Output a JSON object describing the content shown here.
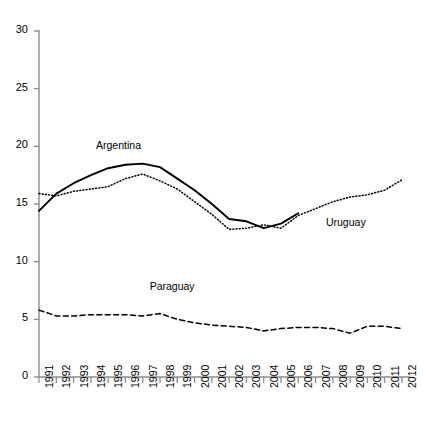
{
  "chart_data": {
    "type": "line",
    "title": "",
    "xlabel": "",
    "ylabel": "",
    "xlim": [
      1991,
      2012
    ],
    "ylim": [
      0,
      30
    ],
    "yticks": [
      0,
      5,
      10,
      15,
      20,
      25,
      30
    ],
    "grid": false,
    "legend_position": "inline-annotations",
    "categories": [
      1991,
      1992,
      1993,
      1994,
      1995,
      1996,
      1997,
      1998,
      1999,
      2000,
      2001,
      2002,
      2003,
      2004,
      2005,
      2006,
      2007,
      2008,
      2009,
      2010,
      2011,
      2012
    ],
    "series": [
      {
        "name": "Argentina",
        "style": "solid",
        "color": "#000000",
        "values": [
          14.4,
          15.9,
          16.8,
          17.5,
          18.1,
          18.4,
          18.5,
          18.2,
          17.2,
          16.2,
          15.0,
          13.7,
          13.5,
          12.9,
          13.3,
          14.2,
          null,
          null,
          null,
          null,
          null,
          null
        ]
      },
      {
        "name": "Uruguay",
        "style": "dotted",
        "color": "#000000",
        "values": [
          15.9,
          15.7,
          16.1,
          16.3,
          16.5,
          17.2,
          17.6,
          17.0,
          16.3,
          15.2,
          14.1,
          12.8,
          12.9,
          13.2,
          12.9,
          14.0,
          14.6,
          15.2,
          15.6,
          15.8,
          16.2,
          17.1
        ]
      },
      {
        "name": "Paraguay",
        "style": "dashed",
        "color": "#000000",
        "values": [
          5.8,
          5.3,
          5.3,
          5.4,
          5.4,
          5.4,
          5.3,
          5.5,
          5.0,
          4.7,
          4.5,
          4.4,
          4.3,
          4.0,
          4.2,
          4.3,
          4.3,
          4.2,
          3.8,
          4.4,
          4.4,
          4.2
        ]
      }
    ],
    "annotations": [
      {
        "text": "Argentina",
        "x": 1994.3,
        "y": 19.9
      },
      {
        "text": "Uruguay",
        "x": 2007.6,
        "y": 13.3
      },
      {
        "text": "Paraguay",
        "x": 1997.4,
        "y": 7.7
      }
    ]
  },
  "axis": {
    "ytick_labels": [
      "0",
      "5",
      "10",
      "15",
      "20",
      "25",
      "30"
    ],
    "xtick_labels": [
      "1991",
      "1992",
      "1993",
      "1994",
      "1995",
      "1996",
      "1997",
      "1998",
      "1999",
      "2000",
      "2001",
      "2002",
      "2003",
      "2004",
      "2005",
      "2006",
      "2007",
      "2008",
      "2009",
      "2010",
      "2011",
      "2012"
    ]
  }
}
